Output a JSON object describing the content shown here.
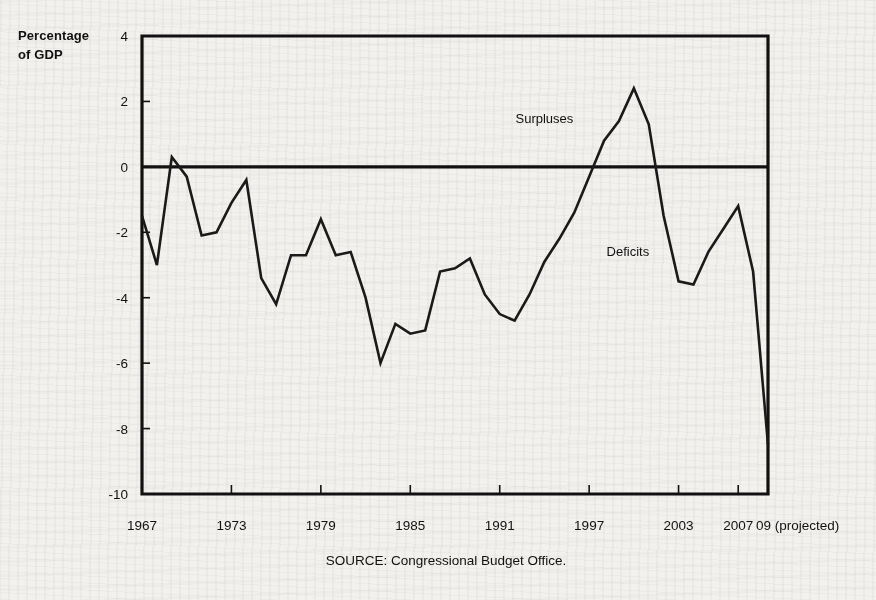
{
  "figure": {
    "y_axis_title": "Percentage\nof GDP",
    "source_note": "SOURCE: Congressional Budget Office.",
    "line_color": "#1a1a1a",
    "axis_color": "#111111",
    "background_color": "#f2f1ee"
  },
  "chart_data": {
    "type": "line",
    "title": "",
    "subtitle": "",
    "xlabel": "",
    "ylabel": "Percentage of GDP",
    "ylim": [
      -10,
      4
    ],
    "xlim": [
      1967,
      2009
    ],
    "yticks": [
      4,
      2,
      0,
      -2,
      -4,
      -6,
      -8,
      -10
    ],
    "ytick_labels": [
      "4",
      "2",
      "0",
      "-2",
      "-4",
      "-6",
      "-8",
      "-10"
    ],
    "xticks": [
      1967,
      1973,
      1979,
      1985,
      1991,
      1997,
      2003,
      2007,
      2009
    ],
    "xtick_labels": [
      "1967",
      "1973",
      "1979",
      "1985",
      "1991",
      "1997",
      "2003",
      "2007",
      "09 (projected)"
    ],
    "grid": false,
    "legend_position": "none",
    "annotations": [
      {
        "text": "Surpluses",
        "x": 1994.0,
        "y": 1.35
      },
      {
        "text": "Deficits",
        "x": 1999.6,
        "y": -2.72
      }
    ],
    "series": [
      {
        "name": "Federal surplus or deficit",
        "x": [
          1967,
          1968,
          1969,
          1970,
          1971,
          1972,
          1973,
          1974,
          1975,
          1976,
          1977,
          1978,
          1979,
          1980,
          1981,
          1982,
          1983,
          1984,
          1985,
          1986,
          1987,
          1988,
          1989,
          1990,
          1991,
          1992,
          1993,
          1994,
          1995,
          1996,
          1997,
          1998,
          1999,
          2000,
          2001,
          2002,
          2003,
          2004,
          2005,
          2006,
          2007,
          2008,
          2009
        ],
        "values": [
          -1.5,
          -3.0,
          0.3,
          -0.3,
          -2.1,
          -2.0,
          -1.1,
          -0.4,
          -3.4,
          -4.2,
          -2.7,
          -2.7,
          -1.6,
          -2.7,
          -2.6,
          -4.0,
          -6.0,
          -4.8,
          -5.1,
          -5.0,
          -3.2,
          -3.1,
          -2.8,
          -3.9,
          -4.5,
          -4.7,
          -3.9,
          -2.9,
          -2.2,
          -1.4,
          -0.3,
          0.8,
          1.4,
          2.4,
          1.3,
          -1.5,
          -3.5,
          -3.6,
          -2.6,
          -1.9,
          -1.2,
          -3.2,
          -8.5
        ],
        "units": "percent of GDP"
      }
    ]
  }
}
